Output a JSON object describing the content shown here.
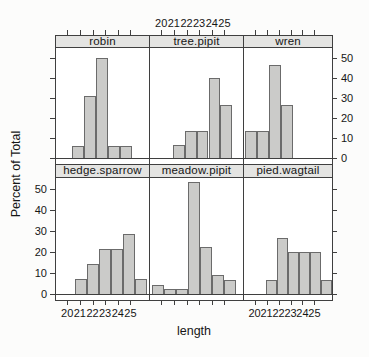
{
  "figure": {
    "bg": "#fcfcfb",
    "panel_border_color": "#3f3f3f",
    "strip_bg": "#e4e4e2",
    "bar_fill": "#cbcbc9",
    "bar_stroke": "#6b6b6b",
    "text_color": "#161616"
  },
  "chart_data": {
    "type": "bar",
    "subtype": "trellis-histogram",
    "title": "",
    "xlabel": "length",
    "ylabel": "Percent of Total",
    "x_tick_labels": [
      "20",
      "21",
      "22",
      "23",
      "24",
      "25"
    ],
    "x_tick_fracs": [
      0.12,
      0.256,
      0.392,
      0.528,
      0.664,
      0.8
    ],
    "y_tick_labels": [
      "0",
      "10",
      "20",
      "30",
      "40",
      "50"
    ],
    "y_tick_values": [
      0,
      10,
      20,
      30,
      40,
      50
    ],
    "ylim": [
      -2.5,
      55.5
    ],
    "grid": "off",
    "legend": "none",
    "layout_note": "2 rows x 3 columns of panels; x axis labeled above middle top panel and below outer bottom panels; y axis labeled right of top row and left of bottom row",
    "rows": [
      {
        "panels": [
          {
            "species": "robin",
            "percent": [
              6.25,
              31.25,
              50,
              6.25,
              6.25
            ],
            "bin_left_x": [
              20.4,
              21.3,
              22.3,
              23.2,
              24.2
            ],
            "start_frac": 0.175,
            "barw_frac": 0.128
          },
          {
            "species": "tree.pipit",
            "percent": [
              6.7,
              13.3,
              13.3,
              40,
              26.7
            ],
            "bin_left_x": [
              20.9,
              21.9,
              22.8,
              23.7,
              24.7
            ],
            "start_frac": 0.245,
            "barw_frac": 0.128
          },
          {
            "species": "wren",
            "percent": [
              13.3,
              13.3,
              46.7,
              26.7
            ],
            "bin_left_x": [
              19.2,
              20.2,
              21.2,
              22.1
            ],
            "start_frac": 0.015,
            "barw_frac": 0.135
          }
        ]
      },
      {
        "panels": [
          {
            "species": "hedge.sparrow",
            "percent": [
              7.1,
              14.3,
              21.4,
              21.4,
              28.6,
              7.1
            ],
            "bin_left_x": [
              20.6,
              21.5,
              22.5,
              23.4,
              24.4,
              25.3
            ],
            "start_frac": 0.2,
            "barw_frac": 0.13
          },
          {
            "species": "meadow.pipit",
            "percent": [
              4.4,
              2.2,
              2.2,
              53.3,
              22.2,
              8.9,
              6.7
            ],
            "bin_left_x": [
              19.3,
              20.2,
              21.2,
              22.1,
              23.1,
              24.0,
              25.0
            ],
            "start_frac": 0.02,
            "barw_frac": 0.13
          },
          {
            "species": "pied.wagtail",
            "percent": [
              6.7,
              26.7,
              20,
              20,
              20,
              6.7
            ],
            "bin_left_x": [
              21.0,
              21.9,
              22.8,
              23.7,
              24.6,
              25.5
            ],
            "start_frac": 0.255,
            "barw_frac": 0.124
          }
        ]
      }
    ]
  }
}
